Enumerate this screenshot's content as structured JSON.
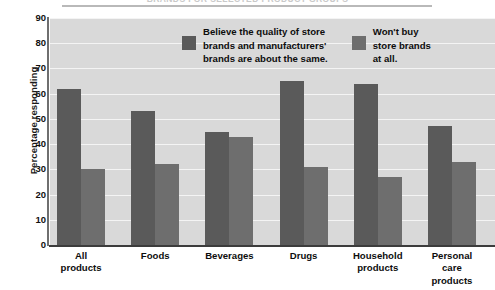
{
  "title": "BRANDS FOR SELECTED PRODUCT GROUPS",
  "axis": {
    "ylabel": "Percentage responding",
    "yticks": [
      "90",
      "80",
      "70",
      "60",
      "50",
      "40",
      "30",
      "20",
      "10",
      "0"
    ]
  },
  "legend": [
    {
      "label": "Believe the quality of store\nbrands and manufacturers'\nbrands are about the same.",
      "color": "#5a5a5a",
      "swatch_name": "legend-swatch-same-quality"
    },
    {
      "label": "Won't buy\nstore brands\nat all.",
      "color": "#6e6e6e",
      "swatch_name": "legend-swatch-wont-buy"
    }
  ],
  "chart_data": {
    "type": "bar",
    "title": "BRANDS FOR SELECTED PRODUCT GROUPS",
    "xlabel": "",
    "ylabel": "Percentage responding",
    "ylim": [
      0,
      90
    ],
    "ytick_step": 10,
    "grid": true,
    "legend_position": "upper-center",
    "categories": [
      "All\nproducts",
      "Foods",
      "Beverages",
      "Drugs",
      "Household\nproducts",
      "Personal\ncare\nproducts"
    ],
    "series": [
      {
        "name": "Believe the quality of store brands and manufacturers' brands are about the same.",
        "color": "#5a5a5a",
        "values": [
          62,
          53,
          45,
          65,
          64,
          47
        ]
      },
      {
        "name": "Won't buy store brands at all.",
        "color": "#6e6e6e",
        "values": [
          30,
          32,
          43,
          31,
          27,
          33
        ]
      }
    ]
  }
}
